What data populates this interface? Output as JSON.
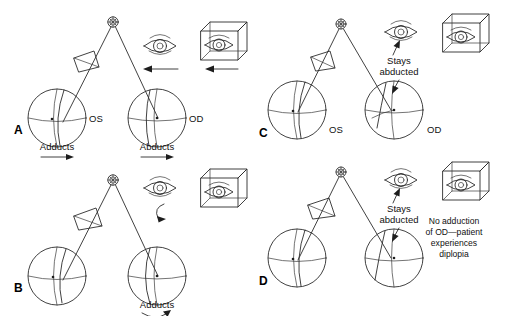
{
  "figure": {
    "background_color": "#ffffff",
    "stroke_color": "#2b2b2b",
    "width": 506,
    "height": 316
  },
  "panels": [
    {
      "id": "A",
      "letter": "A",
      "left_globe_label": "OS",
      "right_globe_label": "OD",
      "left_globe_action": "Adducts",
      "right_globe_action": "Abducts",
      "left_arrow": "straight-right",
      "right_arrow": "straight-right",
      "eye_icon": "eye-open",
      "eye_arrow": "straight-left",
      "box_icon": "eye-in-box",
      "box_arrow": "straight-left",
      "notes": []
    },
    {
      "id": "B",
      "letter": "B",
      "left_globe_label": "",
      "right_globe_label": "",
      "left_globe_action": "",
      "right_globe_action": "Adducts",
      "left_arrow": "",
      "right_arrow": "curved-right",
      "eye_icon": "eye-open",
      "eye_arrow": "curved-right",
      "box_icon": "eye-in-box",
      "box_arrow": "",
      "notes": []
    },
    {
      "id": "C",
      "letter": "C",
      "left_globe_label": "OS",
      "right_globe_label": "OD",
      "left_globe_action": "",
      "right_globe_action": "",
      "left_arrow": "",
      "right_arrow": "",
      "eye_icon": "eye-open",
      "eye_arrow": "pointer-up",
      "box_icon": "eye-in-box",
      "box_arrow": "",
      "notes": [
        {
          "text_lines": [
            "Stays",
            "abducted"
          ],
          "arrow": "pointer-down"
        }
      ]
    },
    {
      "id": "D",
      "letter": "D",
      "left_globe_label": "",
      "right_globe_label": "",
      "left_globe_action": "",
      "right_globe_action": "",
      "left_arrow": "",
      "right_arrow": "",
      "eye_icon": "eye-open",
      "eye_arrow": "pointer-up",
      "box_icon": "eye-in-box",
      "box_arrow": "",
      "notes": [
        {
          "text_lines": [
            "Stays",
            "abducted"
          ],
          "arrow": "pointer-down"
        },
        {
          "text_lines": [
            "No adduction",
            "of OD—patient",
            "experiences",
            "diplopia"
          ],
          "arrow": ""
        }
      ]
    }
  ],
  "text": {
    "a_letter": "A",
    "b_letter": "B",
    "c_letter": "C",
    "d_letter": "D",
    "os": "OS",
    "od": "OD",
    "adducts": "Adducts",
    "abducts": "Abducts",
    "stays": "Stays",
    "abducted": "abducted",
    "diplopia_l1": "No adduction",
    "diplopia_l2": "of OD—patient",
    "diplopia_l3": "experiences",
    "diplopia_l4": "diplopia"
  }
}
